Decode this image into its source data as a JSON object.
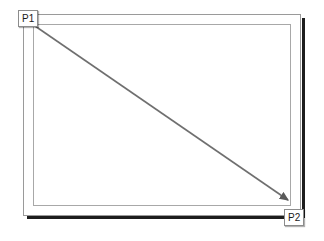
{
  "diagram": {
    "type": "annotated-rectangle-with-diagonal-arrow",
    "canvas": {
      "width": 324,
      "height": 241,
      "background": "#ffffff"
    },
    "outer_frame": {
      "name": "display bezel",
      "x": 23,
      "y": 14,
      "width": 278,
      "height": 202,
      "stroke": "#9a9a9a",
      "stroke_width": 1,
      "fill": "#ffffff"
    },
    "inner_frame": {
      "name": "display screen area",
      "x": 33,
      "y": 24,
      "width": 258,
      "height": 182,
      "stroke": "#a8a8a8",
      "stroke_width": 1,
      "fill": "#ffffff"
    },
    "shadow": {
      "color": "#1d1d1d",
      "right": {
        "x": 302,
        "y": 18,
        "width": 3,
        "height": 200
      },
      "bottom": {
        "x": 27,
        "y": 216,
        "width": 276,
        "height": 3
      }
    },
    "arrow": {
      "from": {
        "label": "P1",
        "x": 35,
        "y": 26
      },
      "to": {
        "label": "P2",
        "x": 288,
        "y": 200
      },
      "stroke": "#6f6f6f",
      "stroke_width": 1.6,
      "arrowhead": "filled-triangle",
      "arrowhead_color": "#5a5a5a"
    },
    "labels": [
      {
        "id": "p1",
        "text": "P1",
        "x": 18,
        "y": 10,
        "anchor": "start-point"
      },
      {
        "id": "p2",
        "text": "P2",
        "x": 284,
        "y": 209,
        "anchor": "end-point"
      }
    ]
  }
}
